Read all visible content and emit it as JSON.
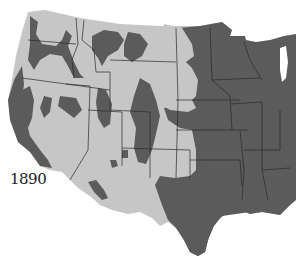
{
  "map": {
    "title": "1890",
    "region": "Western and Central United States",
    "legend": {
      "light_region_color": "#c6c6c6",
      "dark_region_color": "#5b5b5b",
      "border_color": "#2a2a2a",
      "water_color": "#ffffff"
    }
  }
}
